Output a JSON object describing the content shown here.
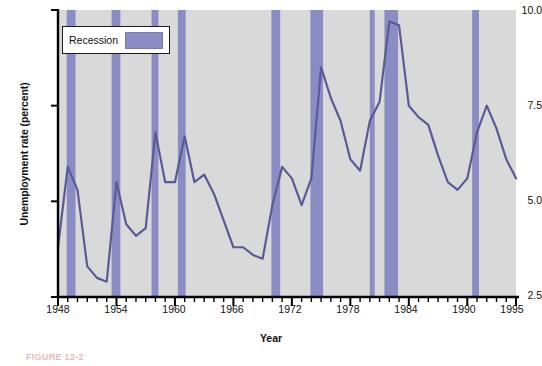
{
  "figure": {
    "caption": "FIGURE 12-2"
  },
  "legend": {
    "label": "Recession",
    "swatch_color": "#8b8cc4"
  },
  "colors": {
    "plot_background": "#d9d9d9",
    "recession_band": "#8b8cc4",
    "line": "#5b5a96",
    "axis": "#000000",
    "page_background": "#ffffff"
  },
  "chart_data": {
    "type": "line",
    "title": "",
    "xlabel": "Year",
    "ylabel": "Unemployment rate (percent)",
    "xlim": [
      1948,
      1995
    ],
    "ylim": [
      2.5,
      10.0
    ],
    "grid": false,
    "legend_position": "top-left",
    "ytick_labels": [
      "2.5",
      "5.0",
      "7.5",
      "10.0"
    ],
    "ytick_values": [
      2.5,
      5.0,
      7.5,
      10.0
    ],
    "xtick_labels": [
      "1948",
      "1954",
      "1960",
      "1966",
      "1972",
      "1978",
      "1984",
      "1990",
      "1995"
    ],
    "xtick_values": [
      1948,
      1954,
      1960,
      1966,
      1972,
      1978,
      1984,
      1990,
      1995
    ],
    "minor_xtick_step": 1,
    "series": [
      {
        "name": "Unemployment rate (percent)",
        "x": [
          1948,
          1949,
          1950,
          1951,
          1952,
          1953,
          1954,
          1955,
          1956,
          1957,
          1958,
          1959,
          1960,
          1961,
          1962,
          1963,
          1964,
          1965,
          1966,
          1967,
          1968,
          1969,
          1970,
          1971,
          1972,
          1973,
          1974,
          1975,
          1976,
          1977,
          1978,
          1979,
          1980,
          1981,
          1982,
          1983,
          1984,
          1985,
          1986,
          1987,
          1988,
          1989,
          1990,
          1991,
          1992,
          1993,
          1994,
          1995
        ],
        "values": [
          3.8,
          5.9,
          5.3,
          3.3,
          3.0,
          2.9,
          5.5,
          4.4,
          4.1,
          4.3,
          6.8,
          5.5,
          5.5,
          6.7,
          5.5,
          5.7,
          5.2,
          4.5,
          3.8,
          3.8,
          3.6,
          3.5,
          4.9,
          5.9,
          5.6,
          4.9,
          5.6,
          8.5,
          7.7,
          7.1,
          6.1,
          5.8,
          7.1,
          7.6,
          9.7,
          9.6,
          7.5,
          7.2,
          7.0,
          6.2,
          5.5,
          5.3,
          5.6,
          6.8,
          7.5,
          6.9,
          6.1,
          5.6
        ]
      }
    ],
    "recessions": [
      {
        "start": 1948.9,
        "end": 1949.8
      },
      {
        "start": 1953.5,
        "end": 1954.4
      },
      {
        "start": 1957.6,
        "end": 1958.3
      },
      {
        "start": 1960.3,
        "end": 1961.1
      },
      {
        "start": 1969.9,
        "end": 1970.8
      },
      {
        "start": 1973.9,
        "end": 1975.2
      },
      {
        "start": 1980.0,
        "end": 1980.5
      },
      {
        "start": 1981.5,
        "end": 1982.9
      },
      {
        "start": 1990.5,
        "end": 1991.2
      }
    ]
  }
}
